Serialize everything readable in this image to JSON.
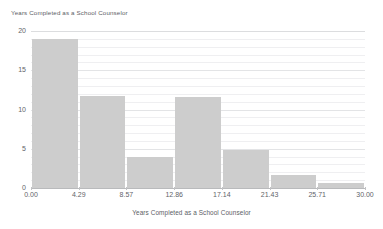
{
  "chart_data": {
    "type": "bar",
    "title": "Years Completed as a School Counselor",
    "subtitle": "",
    "xlabel": "Years Completed as a School Counselor",
    "ylabel": "",
    "grid": true,
    "legend": false,
    "legend_position": "none",
    "bar_color": "#cdcdcd",
    "background_color": "#ffffff",
    "gridline_color": "#efeff1",
    "axis_color": "#b9babc",
    "text_color": "#5f6469",
    "xlim": [
      0.0,
      30.0
    ],
    "ylim": [
      0,
      20
    ],
    "y_ticks": [
      0,
      5,
      10,
      15,
      20
    ],
    "y_tick_labels": [
      "0",
      "5",
      "10",
      "15",
      "20"
    ],
    "x_ticks": [
      0.0,
      4.29,
      8.57,
      12.86,
      17.14,
      21.43,
      25.71,
      30.0
    ],
    "x_tick_labels": [
      "0.00",
      "4.29",
      "8.57",
      "12.86",
      "17.14",
      "21.43",
      "25.71",
      "30.00"
    ],
    "bin_edges": [
      0.0,
      4.29,
      8.57,
      12.86,
      17.14,
      21.43,
      25.71,
      30.0
    ],
    "categories": [
      "0.00-4.29",
      "4.29-8.57",
      "8.57-12.86",
      "12.86-17.14",
      "17.14-21.43",
      "21.43-25.71",
      "25.71-30.00"
    ],
    "values": [
      19.0,
      11.7,
      4.0,
      11.6,
      4.8,
      1.7,
      0.7
    ],
    "annotations": []
  },
  "chart": {
    "title": "Years Completed as a School Counselor",
    "xlabel": "Years Completed as a School Counselor"
  }
}
